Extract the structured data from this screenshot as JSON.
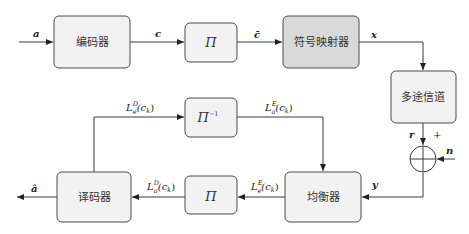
{
  "diagram": {
    "type": "turbo-equalization block diagram",
    "colors": {
      "box_fill": "#f2f2f2",
      "mapper_fill": "#d9d9d9",
      "stroke": "#4a4a4a",
      "background": "#ffffff"
    },
    "blocks": {
      "encoder": "编码器",
      "interleaver_top": "Π",
      "mapper": "符号映射器",
      "channel": "多途信道",
      "equalizer": "均衡器",
      "interleaver_bottom": "Π",
      "deinterleaver": "Π",
      "deinterleaver_sup": "−1",
      "decoder": "译码器"
    },
    "signals": {
      "input": "a",
      "coded": "c",
      "interleaved": "c̄",
      "mapped": "x",
      "received": "r",
      "plus": "+",
      "noise": "n",
      "equalizer_in": "y",
      "output": "â",
      "le_E": {
        "base": "L",
        "sup": "E",
        "sub": "e",
        "arg": "(c",
        "arg_sub": "k",
        "close": ")"
      },
      "la_D": {
        "base": "L",
        "sup": "D",
        "sub": "a",
        "arg": "(c",
        "arg_sub": "k",
        "close": ")"
      },
      "le_D": {
        "base": "L",
        "sup": "D",
        "sub": "e",
        "arg": "(c",
        "arg_sub": "k",
        "close": ")"
      },
      "la_E": {
        "base": "L",
        "sup": "E",
        "sub": "a",
        "arg": "(c",
        "arg_sub": "k",
        "close": ")"
      }
    }
  }
}
